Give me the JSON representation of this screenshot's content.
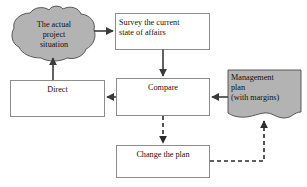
{
  "diagram": {
    "background_color": "#ffffff",
    "shape_fill_white": "#ffffff",
    "shape_fill_gray": "#b3b3b3",
    "border_color": "#8c8c8c",
    "line_color": "#3a3a3a",
    "text_color": "#111111",
    "nodes": [
      {
        "id": "actual-situation",
        "label": "The actual\nproject\nsituation",
        "shape": "cloud",
        "fill": "gray"
      },
      {
        "id": "survey",
        "label": "Survey the current\nstate of affairs",
        "shape": "rectangle",
        "fill": "white"
      },
      {
        "id": "compare",
        "label": "Compare",
        "shape": "rectangle",
        "fill": "white"
      },
      {
        "id": "direct",
        "label": "Direct",
        "shape": "rectangle",
        "fill": "white"
      },
      {
        "id": "management-plan",
        "label": "Management\nplan\n(with margins)",
        "shape": "document",
        "fill": "gray"
      },
      {
        "id": "change-plan",
        "label": "Change the plan",
        "shape": "rectangle",
        "fill": "white"
      }
    ],
    "edges": [
      {
        "id": "actual-situation-to-survey",
        "from": "actual-situation",
        "to": "survey",
        "style": "solid",
        "direction": "right"
      },
      {
        "id": "survey-to-compare",
        "from": "survey",
        "to": "compare",
        "style": "solid",
        "direction": "down"
      },
      {
        "id": "compare-to-direct",
        "from": "compare",
        "to": "direct",
        "style": "solid",
        "direction": "left"
      },
      {
        "id": "direct-to-actual-situation",
        "from": "direct",
        "to": "actual-situation",
        "style": "solid",
        "direction": "up"
      },
      {
        "id": "management-plan-to-compare",
        "from": "management-plan",
        "to": "compare",
        "style": "solid",
        "direction": "left"
      },
      {
        "id": "compare-to-change-plan",
        "from": "compare",
        "to": "change-plan",
        "style": "dashed",
        "direction": "down"
      },
      {
        "id": "change-plan-to-management-plan",
        "from": "change-plan",
        "to": "management-plan",
        "style": "dashed",
        "direction": "up"
      }
    ]
  }
}
